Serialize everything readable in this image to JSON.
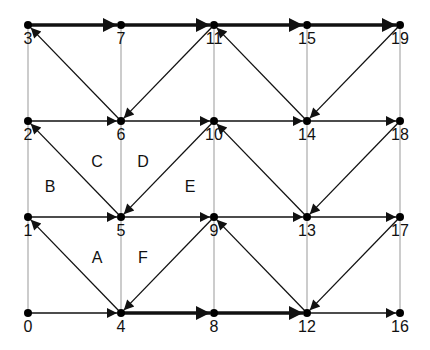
{
  "diagram": {
    "colors": {
      "edge": "#111111",
      "grid": "#aaaaaa",
      "node": "#000000",
      "background": "#ffffff"
    },
    "nodes": [
      {
        "id": "0",
        "label": "0",
        "x": 28,
        "y": 313
      },
      {
        "id": "1",
        "label": "1",
        "x": 28,
        "y": 217
      },
      {
        "id": "2",
        "label": "2",
        "x": 28,
        "y": 121
      },
      {
        "id": "3",
        "label": "3",
        "x": 28,
        "y": 25
      },
      {
        "id": "4",
        "label": "4",
        "x": 121,
        "y": 313
      },
      {
        "id": "5",
        "label": "5",
        "x": 121,
        "y": 217
      },
      {
        "id": "6",
        "label": "6",
        "x": 121,
        "y": 121
      },
      {
        "id": "7",
        "label": "7",
        "x": 121,
        "y": 25
      },
      {
        "id": "8",
        "label": "8",
        "x": 214,
        "y": 313
      },
      {
        "id": "9",
        "label": "9",
        "x": 214,
        "y": 217
      },
      {
        "id": "10",
        "label": "10",
        "x": 214,
        "y": 121
      },
      {
        "id": "11",
        "label": "11",
        "x": 214,
        "y": 25
      },
      {
        "id": "12",
        "label": "12",
        "x": 307,
        "y": 313
      },
      {
        "id": "13",
        "label": "13",
        "x": 307,
        "y": 217
      },
      {
        "id": "14",
        "label": "14",
        "x": 307,
        "y": 121
      },
      {
        "id": "15",
        "label": "15",
        "x": 307,
        "y": 25
      },
      {
        "id": "16",
        "label": "16",
        "x": 400,
        "y": 313
      },
      {
        "id": "17",
        "label": "17",
        "x": 400,
        "y": 217
      },
      {
        "id": "18",
        "label": "18",
        "x": 400,
        "y": 121
      },
      {
        "id": "19",
        "label": "19",
        "x": 400,
        "y": 25
      }
    ],
    "grid_lines": [
      [
        "0",
        "1"
      ],
      [
        "1",
        "2"
      ],
      [
        "2",
        "3"
      ],
      [
        "4",
        "5"
      ],
      [
        "5",
        "6"
      ],
      [
        "6",
        "7"
      ],
      [
        "8",
        "9"
      ],
      [
        "9",
        "10"
      ],
      [
        "10",
        "11"
      ],
      [
        "12",
        "13"
      ],
      [
        "13",
        "14"
      ],
      [
        "14",
        "15"
      ],
      [
        "16",
        "17"
      ],
      [
        "17",
        "18"
      ],
      [
        "18",
        "19"
      ]
    ],
    "edges": [
      {
        "from": "3",
        "to": "7",
        "thick": true
      },
      {
        "from": "7",
        "to": "11",
        "thick": true
      },
      {
        "from": "11",
        "to": "15",
        "thick": true
      },
      {
        "from": "15",
        "to": "19",
        "thick": true
      },
      {
        "from": "4",
        "to": "8",
        "thick": true
      },
      {
        "from": "8",
        "to": "12",
        "thick": true
      },
      {
        "from": "2",
        "to": "6",
        "thick": false
      },
      {
        "from": "6",
        "to": "10",
        "thick": false
      },
      {
        "from": "10",
        "to": "14",
        "thick": false
      },
      {
        "from": "14",
        "to": "18",
        "thick": false
      },
      {
        "from": "1",
        "to": "5",
        "thick": false
      },
      {
        "from": "5",
        "to": "9",
        "thick": false
      },
      {
        "from": "9",
        "to": "13",
        "thick": false
      },
      {
        "from": "13",
        "to": "17",
        "thick": false
      },
      {
        "from": "0",
        "to": "4",
        "thick": false
      },
      {
        "from": "12",
        "to": "16",
        "thick": false
      },
      {
        "from": "6",
        "to": "3",
        "thick": false
      },
      {
        "from": "11",
        "to": "6",
        "thick": false
      },
      {
        "from": "14",
        "to": "11",
        "thick": false
      },
      {
        "from": "19",
        "to": "14",
        "thick": false
      },
      {
        "from": "5",
        "to": "2",
        "thick": false
      },
      {
        "from": "10",
        "to": "5",
        "thick": false
      },
      {
        "from": "13",
        "to": "10",
        "thick": false
      },
      {
        "from": "18",
        "to": "13",
        "thick": false
      },
      {
        "from": "4",
        "to": "1",
        "thick": false
      },
      {
        "from": "9",
        "to": "4",
        "thick": false
      },
      {
        "from": "12",
        "to": "9",
        "thick": false
      },
      {
        "from": "17",
        "to": "12",
        "thick": false
      }
    ],
    "regions": [
      {
        "label": "A",
        "x": 97,
        "y": 259
      },
      {
        "label": "B",
        "x": 50,
        "y": 188
      },
      {
        "label": "C",
        "x": 97,
        "y": 163
      },
      {
        "label": "D",
        "x": 143,
        "y": 163
      },
      {
        "label": "E",
        "x": 190,
        "y": 188
      },
      {
        "label": "F",
        "x": 143,
        "y": 259
      }
    ]
  }
}
